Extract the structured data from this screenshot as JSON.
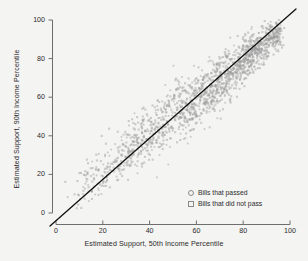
{
  "chart_data": {
    "type": "scatter",
    "title": "",
    "xlabel": "Estimated Support, 50th Income Percentile",
    "ylabel": "Estimated Support, 90th Income Percentile",
    "xlim": [
      0,
      100
    ],
    "ylim": [
      0,
      100
    ],
    "xticks": [
      0,
      20,
      40,
      60,
      80,
      100
    ],
    "yticks": [
      0,
      20,
      40,
      60,
      80,
      100
    ],
    "grid": false,
    "legend_position": "lower-right",
    "point_color": "#9a9a9a",
    "point_opacity": 0.45,
    "point_size_px": 2.1,
    "reference_line": {
      "type": "identity",
      "slope": 1,
      "intercept": 0,
      "color": "#111111",
      "width_px": 1.3,
      "extends_beyond_axes": true
    },
    "series": [
      {
        "name": "Bills that passed",
        "marker": "circle-open",
        "n_points": 520,
        "color": "#9a9a9a"
      },
      {
        "name": "Bills that did not pass",
        "marker": "square-open",
        "n_points": 1080,
        "color": "#9a9a9a"
      }
    ]
  },
  "axes": {
    "x_tick_labels": [
      "0",
      "20",
      "40",
      "60",
      "80",
      "100"
    ],
    "y_tick_labels": [
      "0",
      "20",
      "40",
      "60",
      "80",
      "100"
    ]
  },
  "legend": {
    "items": [
      {
        "label": "Bills that passed",
        "marker": "circle"
      },
      {
        "label": "Bills that did not pass",
        "marker": "square"
      }
    ]
  }
}
